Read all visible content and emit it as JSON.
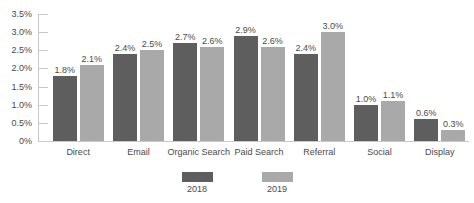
{
  "chart_data": {
    "type": "bar",
    "title": "",
    "subtitle": "",
    "xlabel": "",
    "ylabel": "",
    "grid": false,
    "legend_position": "bottom",
    "ylim": [
      0,
      3.5
    ],
    "ytick_labels": [
      "3.5%",
      "3.0%",
      "2.5%",
      "2.0%",
      "1.5%",
      "1.0%",
      "0.5%",
      "0%"
    ],
    "ytick_values": [
      3.5,
      3.0,
      2.5,
      2.0,
      1.5,
      1.0,
      0.5,
      0
    ],
    "categories": [
      "Direct",
      "Email",
      "Organic Search",
      "Paid Search",
      "Referral",
      "Social",
      "Display"
    ],
    "series": [
      {
        "name": "2018",
        "color": "#5e5e5e",
        "values": [
          1.8,
          2.4,
          2.7,
          2.9,
          2.4,
          1.0,
          0.6
        ],
        "labels": [
          "1.8%",
          "2.4%",
          "2.7%",
          "2.9%",
          "2.4%",
          "1.0%",
          "0.6%"
        ]
      },
      {
        "name": "2019",
        "color": "#a9a9a9",
        "values": [
          2.1,
          2.5,
          2.6,
          2.6,
          3.0,
          1.1,
          0.3
        ],
        "labels": [
          "2.1%",
          "2.5%",
          "2.6%",
          "2.6%",
          "3.0%",
          "1.1%",
          "0.3%"
        ]
      }
    ]
  },
  "axis": {
    "line_color": "#c8c8c8",
    "text_color": "#4a4a4a"
  },
  "legend": {
    "entries": [
      {
        "label": "2018",
        "color": "#5e5e5e"
      },
      {
        "label": "2019",
        "color": "#a9a9a9"
      }
    ]
  }
}
